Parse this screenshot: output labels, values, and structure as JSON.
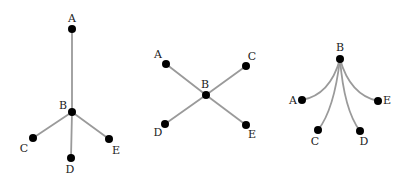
{
  "diagrams": [
    {
      "id": "tree-vertical",
      "nodes": [
        {
          "name": "A",
          "x": 72,
          "y": 29,
          "lx": 72,
          "ly": 19
        },
        {
          "name": "B",
          "x": 72,
          "y": 112,
          "lx": 63,
          "ly": 106
        },
        {
          "name": "C",
          "x": 33,
          "y": 138,
          "lx": 24,
          "ly": 149
        },
        {
          "name": "D",
          "x": 71,
          "y": 158,
          "lx": 70,
          "ly": 170
        },
        {
          "name": "E",
          "x": 109,
          "y": 139,
          "lx": 116,
          "ly": 151
        }
      ],
      "edges": [
        {
          "from": "B",
          "to": "A",
          "curve": false
        },
        {
          "from": "B",
          "to": "C",
          "curve": false
        },
        {
          "from": "B",
          "to": "D",
          "curve": false
        },
        {
          "from": "B",
          "to": "E",
          "curve": false
        }
      ]
    },
    {
      "id": "tree-cross",
      "nodes": [
        {
          "name": "A",
          "x": 166,
          "y": 64,
          "lx": 158,
          "ly": 55
        },
        {
          "name": "B",
          "x": 206,
          "y": 95,
          "lx": 205,
          "ly": 85
        },
        {
          "name": "C",
          "x": 246,
          "y": 66,
          "lx": 252,
          "ly": 57
        },
        {
          "name": "D",
          "x": 165,
          "y": 124,
          "lx": 158,
          "ly": 133
        },
        {
          "name": "E",
          "x": 246,
          "y": 125,
          "lx": 252,
          "ly": 135
        }
      ],
      "edges": [
        {
          "from": "B",
          "to": "A",
          "curve": false
        },
        {
          "from": "B",
          "to": "C",
          "curve": false
        },
        {
          "from": "B",
          "to": "D",
          "curve": false
        },
        {
          "from": "B",
          "to": "E",
          "curve": false
        }
      ]
    },
    {
      "id": "tree-fan",
      "nodes": [
        {
          "name": "B",
          "x": 340,
          "y": 59,
          "lx": 340,
          "ly": 48
        },
        {
          "name": "A",
          "x": 302,
          "y": 100,
          "lx": 293,
          "ly": 101
        },
        {
          "name": "C",
          "x": 318,
          "y": 130,
          "lx": 315,
          "ly": 142
        },
        {
          "name": "D",
          "x": 360,
          "y": 131,
          "lx": 364,
          "ly": 142
        },
        {
          "name": "E",
          "x": 378,
          "y": 101,
          "lx": 387,
          "ly": 101
        }
      ],
      "edges": [
        {
          "from": "B",
          "to": "A",
          "curve": true,
          "cx": 330,
          "cy": 95
        },
        {
          "from": "B",
          "to": "C",
          "curve": true,
          "cx": 334,
          "cy": 110
        },
        {
          "from": "B",
          "to": "D",
          "curve": true,
          "cx": 344,
          "cy": 110
        },
        {
          "from": "B",
          "to": "E",
          "curve": true,
          "cx": 350,
          "cy": 95
        }
      ]
    }
  ],
  "style": {
    "edge_color": "#9a9a9a",
    "node_color": "#000000",
    "label_color": "#222222",
    "node_radius": 4
  }
}
